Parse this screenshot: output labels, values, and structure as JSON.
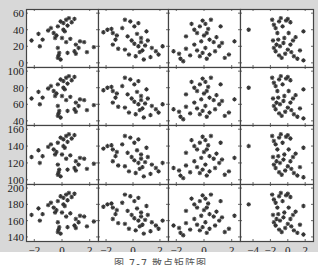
{
  "caption": "图 7-7  散点矩阵图",
  "chart_data": {
    "type": "scatter",
    "title": "",
    "marker": "*",
    "marker_color": "#333333",
    "layout": {
      "rows": 4,
      "cols": 4,
      "grid": false
    },
    "columns": [
      {
        "xlim": [
          -2.6,
          2.6
        ],
        "xticks": [
          -2,
          0,
          2
        ]
      },
      {
        "xlim": [
          -2.6,
          2.6
        ],
        "xticks": [
          -2,
          0,
          2
        ]
      },
      {
        "xlim": [
          -2.6,
          2.6
        ],
        "xticks": [
          -2,
          0,
          2
        ]
      },
      {
        "xlim": [
          -5.5,
          2.9
        ],
        "xticks": [
          -4,
          -2,
          0,
          2
        ]
      }
    ],
    "rows": [
      {
        "ylim": [
          -5,
          65
        ],
        "yticks": [
          0,
          20,
          40,
          60
        ],
        "offset": 0
      },
      {
        "ylim": [
          35,
          105
        ],
        "yticks": [
          40,
          60,
          80,
          100
        ],
        "offset": 40
      },
      {
        "ylim": [
          95,
          165
        ],
        "yticks": [
          100,
          120,
          140,
          160
        ],
        "offset": 100
      },
      {
        "ylim": [
          135,
          205
        ],
        "yticks": [
          140,
          160,
          180,
          200
        ],
        "offset": 140
      }
    ],
    "series": [
      {
        "name": "col1",
        "points": [
          [
            -2.2,
            27
          ],
          [
            -1.7,
            35
          ],
          [
            -1.4,
            28
          ],
          [
            -1.6,
            20
          ],
          [
            -1.0,
            39
          ],
          [
            -0.8,
            42
          ],
          [
            -0.6,
            36
          ],
          [
            -0.4,
            33
          ],
          [
            -0.3,
            44
          ],
          [
            -0.1,
            50
          ],
          [
            0.1,
            48
          ],
          [
            0.3,
            52
          ],
          [
            0.5,
            54
          ],
          [
            0.7,
            49
          ],
          [
            0.9,
            53
          ],
          [
            0.4,
            45
          ],
          [
            0.2,
            38
          ],
          [
            0.0,
            30
          ],
          [
            0.3,
            25
          ],
          [
            0.6,
            29
          ],
          [
            -0.3,
            18
          ],
          [
            -0.2,
            12
          ],
          [
            -0.3,
            6
          ],
          [
            -0.1,
            4
          ],
          [
            -0.25,
            9
          ],
          [
            0.4,
            12
          ],
          [
            1.0,
            22
          ],
          [
            1.3,
            26
          ],
          [
            1.6,
            25
          ],
          [
            1.2,
            18
          ],
          [
            1.0,
            11
          ],
          [
            0.9,
            14
          ],
          [
            1.8,
            13
          ],
          [
            2.3,
            19
          ],
          [
            0.1,
            40
          ],
          [
            -0.5,
            30
          ]
        ]
      },
      {
        "name": "col2",
        "points": [
          [
            -2.2,
            37
          ],
          [
            -1.9,
            40
          ],
          [
            -1.6,
            41
          ],
          [
            -1.5,
            36
          ],
          [
            -1.2,
            33
          ],
          [
            -1.3,
            28
          ],
          [
            -1.5,
            22
          ],
          [
            -1.1,
            17
          ],
          [
            -0.6,
            52
          ],
          [
            -0.2,
            50
          ],
          [
            0.1,
            44
          ],
          [
            0.4,
            48
          ],
          [
            -0.4,
            32
          ],
          [
            -0.1,
            27
          ],
          [
            0.3,
            35
          ],
          [
            0.6,
            30
          ],
          [
            0.1,
            23
          ],
          [
            0.4,
            20
          ],
          [
            0.7,
            15
          ],
          [
            0.9,
            21
          ],
          [
            1.1,
            27
          ],
          [
            1.4,
            18
          ],
          [
            1.7,
            14
          ],
          [
            2.2,
            20
          ],
          [
            1.9,
            10
          ],
          [
            1.3,
            7
          ],
          [
            0.8,
            4
          ],
          [
            0.2,
            8
          ],
          [
            -0.3,
            10
          ],
          [
            -0.6,
            16
          ],
          [
            0.5,
            13
          ],
          [
            1.0,
            38
          ],
          [
            0.6,
            25
          ],
          [
            -0.8,
            42
          ]
        ]
      },
      {
        "name": "col3",
        "points": [
          [
            -2.2,
            14
          ],
          [
            -1.8,
            11
          ],
          [
            -1.7,
            5
          ],
          [
            -1.5,
            2
          ],
          [
            -1.3,
            17
          ],
          [
            -1.0,
            9
          ],
          [
            -0.7,
            22
          ],
          [
            -0.5,
            15
          ],
          [
            -0.3,
            8
          ],
          [
            -0.1,
            12
          ],
          [
            0.1,
            18
          ],
          [
            0.2,
            5
          ],
          [
            0.4,
            10
          ],
          [
            -0.9,
            47
          ],
          [
            -0.7,
            40
          ],
          [
            -0.5,
            36
          ],
          [
            -0.3,
            44
          ],
          [
            -0.1,
            51
          ],
          [
            0.1,
            47
          ],
          [
            0.3,
            41
          ],
          [
            0.5,
            52
          ],
          [
            0.0,
            33
          ],
          [
            0.4,
            28
          ],
          [
            0.7,
            25
          ],
          [
            0.9,
            31
          ],
          [
            1.1,
            20
          ],
          [
            1.3,
            24
          ],
          [
            1.5,
            6
          ],
          [
            1.8,
            10
          ],
          [
            2.2,
            26
          ],
          [
            1.2,
            44
          ],
          [
            -1.3,
            32
          ],
          [
            0.2,
            36
          ],
          [
            -0.2,
            26
          ],
          [
            0.8,
            14
          ]
        ]
      },
      {
        "name": "col4",
        "points": [
          [
            -4.5,
            40
          ],
          [
            -1.8,
            52
          ],
          [
            -1.6,
            46
          ],
          [
            -1.4,
            42
          ],
          [
            -1.2,
            36
          ],
          [
            -1.0,
            50
          ],
          [
            -0.8,
            54
          ],
          [
            -0.6,
            44
          ],
          [
            -0.4,
            30
          ],
          [
            -0.2,
            51
          ],
          [
            0.0,
            53
          ],
          [
            0.3,
            49
          ],
          [
            -1.1,
            28
          ],
          [
            -1.3,
            22
          ],
          [
            -1.6,
            18
          ],
          [
            -1.4,
            14
          ],
          [
            -1.0,
            9
          ],
          [
            -0.7,
            6
          ],
          [
            -0.3,
            11
          ],
          [
            0.0,
            16
          ],
          [
            0.3,
            22
          ],
          [
            0.6,
            27
          ],
          [
            0.9,
            31
          ],
          [
            0.4,
            13
          ],
          [
            0.7,
            8
          ],
          [
            1.1,
            5
          ],
          [
            1.4,
            15
          ],
          [
            1.8,
            38
          ],
          [
            1.8,
            3
          ],
          [
            -0.9,
            20
          ],
          [
            -0.5,
            24
          ],
          [
            0.1,
            36
          ],
          [
            -1.7,
            27
          ]
        ]
      }
    ]
  }
}
